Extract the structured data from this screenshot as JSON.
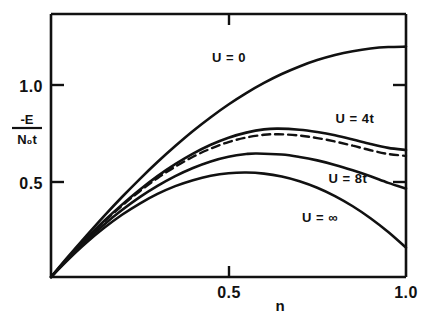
{
  "chart_data": {
    "type": "line",
    "title": "",
    "xlabel": "n",
    "ylabel_numerator": "-E",
    "ylabel_denominator": "N₀t",
    "ylabel": "-E / N₀t",
    "xlim": [
      0,
      1.0
    ],
    "ylim": [
      0,
      1.45
    ],
    "xticks": [
      0.5,
      1.0
    ],
    "xtick_labels": [
      "0.5",
      "1.0"
    ],
    "yticks": [
      0.5,
      1.0
    ],
    "ytick_labels": [
      "0.5",
      "1.0"
    ],
    "grid": false,
    "legend": "inline-annotations",
    "series": [
      {
        "name": "U = 0",
        "label": "U = 0",
        "style": "solid",
        "label_x": 0.5,
        "label_y": 1.16,
        "x": [
          0.0,
          0.05,
          0.1,
          0.15,
          0.2,
          0.25,
          0.3,
          0.35,
          0.4,
          0.45,
          0.5,
          0.55,
          0.6,
          0.65,
          0.7,
          0.75,
          0.8,
          0.85,
          0.9,
          0.95,
          1.0
        ],
        "y": [
          0.0,
          0.116,
          0.228,
          0.337,
          0.441,
          0.54,
          0.634,
          0.722,
          0.805,
          0.881,
          0.951,
          1.014,
          1.07,
          1.119,
          1.161,
          1.196,
          1.224,
          1.245,
          1.26,
          1.268,
          1.27
        ]
      },
      {
        "name": "U = 4t",
        "label": "U = 4t",
        "style": "solid",
        "label_x": 0.93,
        "label_y": 0.965,
        "x": [
          0.0,
          0.05,
          0.1,
          0.15,
          0.2,
          0.25,
          0.3,
          0.35,
          0.4,
          0.45,
          0.5,
          0.55,
          0.6,
          0.64,
          0.7,
          0.75,
          0.8,
          0.85,
          0.9,
          0.95,
          1.0
        ],
        "y": [
          0.0,
          0.11,
          0.213,
          0.31,
          0.399,
          0.481,
          0.556,
          0.622,
          0.68,
          0.729,
          0.768,
          0.796,
          0.814,
          0.818,
          0.812,
          0.799,
          0.781,
          0.758,
          0.733,
          0.712,
          0.7
        ]
      },
      {
        "name": "U = 4t (dashed)",
        "label": "",
        "style": "dashed",
        "x": [
          0.0,
          0.05,
          0.1,
          0.15,
          0.2,
          0.25,
          0.3,
          0.35,
          0.4,
          0.45,
          0.5,
          0.55,
          0.6,
          0.64,
          0.7,
          0.75,
          0.8,
          0.85,
          0.9,
          0.95,
          1.0
        ],
        "y": [
          0.0,
          0.109,
          0.211,
          0.306,
          0.393,
          0.473,
          0.545,
          0.608,
          0.663,
          0.708,
          0.744,
          0.769,
          0.784,
          0.787,
          0.78,
          0.766,
          0.747,
          0.724,
          0.699,
          0.678,
          0.668
        ]
      },
      {
        "name": "U = 8t",
        "label": "U = 8t",
        "style": "solid",
        "label_x": 0.91,
        "label_y": 0.655,
        "x": [
          0.0,
          0.05,
          0.1,
          0.15,
          0.2,
          0.25,
          0.3,
          0.35,
          0.4,
          0.45,
          0.5,
          0.55,
          0.58,
          0.65,
          0.7,
          0.75,
          0.8,
          0.85,
          0.9,
          0.95,
          1.0
        ],
        "y": [
          0.0,
          0.105,
          0.202,
          0.29,
          0.369,
          0.44,
          0.502,
          0.556,
          0.601,
          0.637,
          0.663,
          0.678,
          0.681,
          0.675,
          0.662,
          0.643,
          0.618,
          0.588,
          0.555,
          0.519,
          0.488
        ]
      },
      {
        "name": "U = ∞",
        "label": "U = ∞",
        "style": "solid",
        "label_x": 0.77,
        "label_y": 0.31,
        "x": [
          0.0,
          0.05,
          0.1,
          0.15,
          0.2,
          0.25,
          0.3,
          0.35,
          0.4,
          0.45,
          0.5,
          0.55,
          0.6,
          0.65,
          0.7,
          0.75,
          0.8,
          0.85,
          0.9,
          0.95,
          1.0
        ],
        "y": [
          0.0,
          0.099,
          0.19,
          0.271,
          0.343,
          0.405,
          0.458,
          0.501,
          0.534,
          0.558,
          0.572,
          0.576,
          0.57,
          0.554,
          0.528,
          0.492,
          0.446,
          0.39,
          0.324,
          0.248,
          0.162
        ]
      }
    ]
  },
  "labels": {
    "x_axis_name": "n",
    "y_tick_1": "1.0",
    "y_tick_05": "0.5",
    "x_tick_05": "0.5",
    "x_tick_10": "1.0",
    "y_num": "-E",
    "y_den": "N₀t",
    "curve_u0": "U = 0",
    "curve_u4t": "U = 4t",
    "curve_u8t": "U = 8t",
    "curve_uinf": "U = ∞"
  },
  "colors": {
    "ink": "#111111",
    "background": "#ffffff"
  }
}
